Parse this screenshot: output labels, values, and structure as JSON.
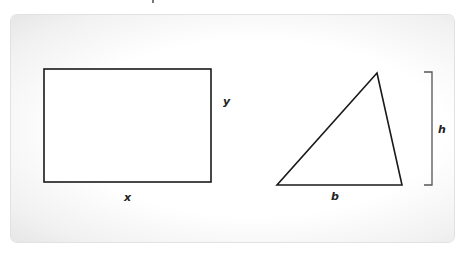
{
  "diagram": {
    "rectangle": {
      "width_label": "x",
      "height_label": "y",
      "bounds": {
        "x": 44,
        "y": 69,
        "w": 167,
        "h": 113
      }
    },
    "triangle": {
      "base_label": "b",
      "height_label": "h",
      "vertices": [
        [
          377,
          73
        ],
        [
          277,
          185
        ],
        [
          402,
          185
        ]
      ],
      "height_bracket": {
        "x": 432,
        "y1": 72,
        "y2": 185
      }
    },
    "colors": {
      "stroke": "#1a1a1a",
      "bracket": "#555555",
      "background": "#ffffff"
    }
  }
}
